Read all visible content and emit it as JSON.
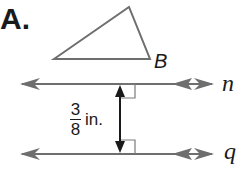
{
  "part_label": "A.",
  "triangle": {
    "vertex_label": "B",
    "vertices": [
      [
        54,
        59
      ],
      [
        129,
        7
      ],
      [
        150,
        59
      ]
    ]
  },
  "lines": [
    {
      "name": "n",
      "y": 84
    },
    {
      "name": "q",
      "y": 154
    }
  ],
  "distance": {
    "numerator": "3",
    "denominator": "8",
    "unit": "in."
  },
  "colors": {
    "stroke": "#6e6e6e",
    "arrow": "#1a1a1a",
    "text": "#1a1a1a"
  }
}
